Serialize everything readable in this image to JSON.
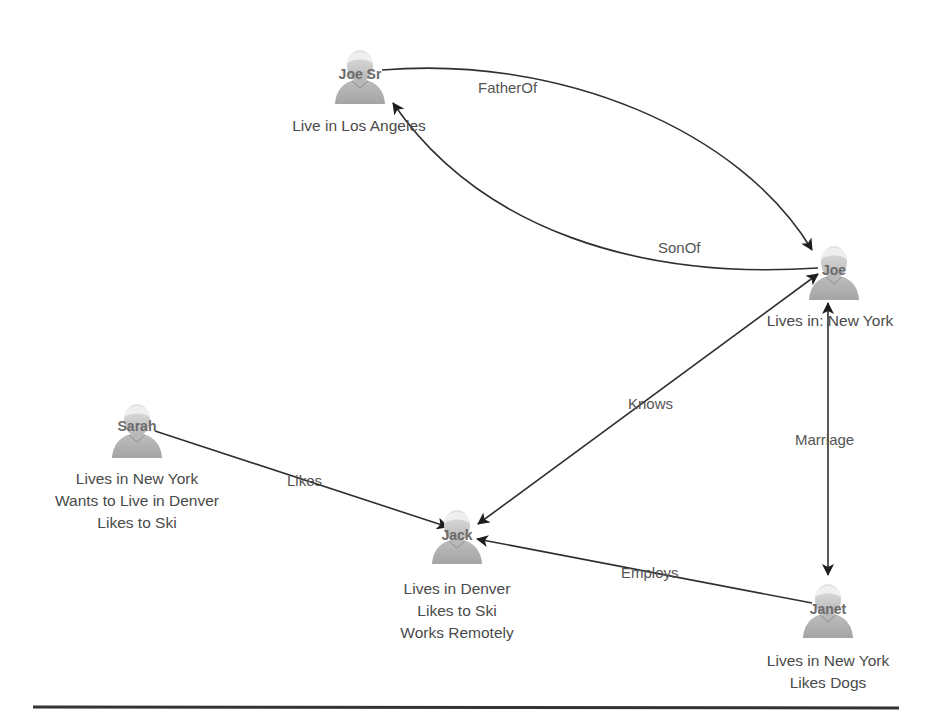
{
  "diagram": {
    "nodes": [
      {
        "id": "joe-sr",
        "name": "Joe Sr",
        "description": [
          "Live in Los Angeles"
        ]
      },
      {
        "id": "joe",
        "name": "Joe",
        "description": [
          "Lives in: New York"
        ]
      },
      {
        "id": "sarah",
        "name": "Sarah",
        "description": [
          "Lives in New York",
          "Wants to Live in Denver",
          "Likes to Ski"
        ]
      },
      {
        "id": "jack",
        "name": "Jack",
        "description": [
          "Lives in Denver",
          "Likes to Ski",
          "Works Remotely"
        ]
      },
      {
        "id": "janet",
        "name": "Janet",
        "description": [
          "Lives in New York",
          "Likes Dogs"
        ]
      }
    ],
    "edges": [
      {
        "from": "Joe Sr",
        "to": "Joe",
        "label": "FatherOf"
      },
      {
        "from": "Joe",
        "to": "Joe Sr",
        "label": "SonOf"
      },
      {
        "from": "Joe",
        "to": "Jack",
        "label": "Knows",
        "bidirectional": true
      },
      {
        "from": "Joe",
        "to": "Janet",
        "label": "Marriage",
        "bidirectional": true
      },
      {
        "from": "Sarah",
        "to": "Jack",
        "label": "Likes"
      },
      {
        "from": "Janet",
        "to": "Jack",
        "label": "Employs"
      }
    ],
    "icon": "person-avatar-icon",
    "colors": {
      "edge": "#2f2f2f",
      "label": "#555555",
      "avatar": "#b8b8b8"
    }
  }
}
